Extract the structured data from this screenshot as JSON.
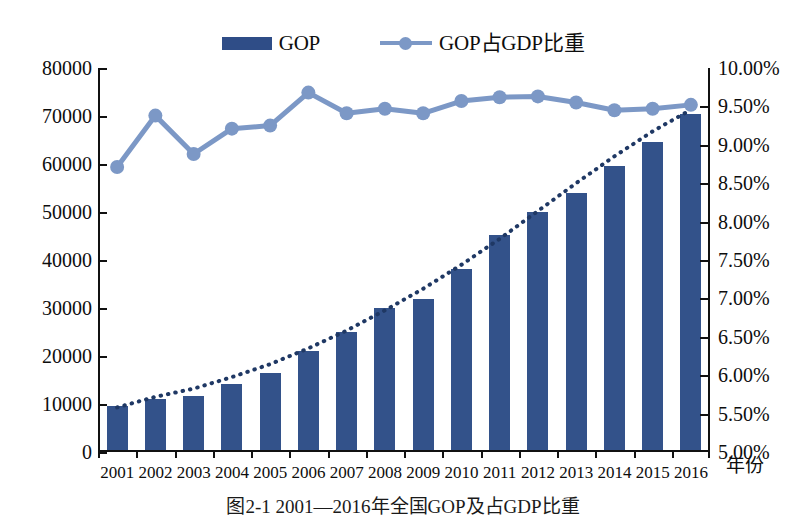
{
  "chart_data": {
    "type": "bar",
    "title": "",
    "xlabel": "年份",
    "categories": [
      "2001",
      "2002",
      "2003",
      "2004",
      "2005",
      "2006",
      "2007",
      "2008",
      "2009",
      "2010",
      "2011",
      "2012",
      "2013",
      "2014",
      "2015",
      "2016"
    ],
    "grid": false,
    "legend_position": "top-center",
    "series": [
      {
        "name": "GOP",
        "type": "bar",
        "axis": "left",
        "color": "#33528a",
        "values": [
          9500,
          11000,
          11700,
          14100,
          16500,
          21000,
          25000,
          29900,
          31800,
          38200,
          45300,
          50000,
          54000,
          59500,
          64500,
          70500
        ]
      },
      {
        "name": "GOP占GDP比重",
        "type": "line",
        "axis": "right",
        "color": "#7c98c6",
        "values": [
          8.71,
          9.38,
          8.88,
          9.21,
          9.25,
          9.68,
          9.41,
          9.47,
          9.41,
          9.57,
          9.62,
          9.63,
          9.55,
          9.45,
          9.47,
          9.52
        ]
      },
      {
        "name": "trend",
        "type": "dotted-trend",
        "axis": "left",
        "color": "#1f3864",
        "values": [
          9300,
          11500,
          13200,
          15600,
          18300,
          21600,
          25300,
          29500,
          34000,
          39000,
          44400,
          50200,
          56000,
          61600,
          66800,
          71300
        ]
      }
    ],
    "ylim": [
      0,
      80000
    ],
    "yticks": [
      "0",
      "10000",
      "20000",
      "30000",
      "40000",
      "50000",
      "60000",
      "70000",
      "80000"
    ],
    "ylim_right": [
      5.0,
      10.0
    ],
    "yticks_right": [
      "5.00%",
      "5.50%",
      "6.00%",
      "6.50%",
      "7.00%",
      "7.50%",
      "8.00%",
      "8.50%",
      "9.00%",
      "9.50%",
      "10.00%"
    ],
    "ylabel": "",
    "ylabel_right": ""
  },
  "legend": {
    "items": [
      {
        "label": "GOP",
        "marker": "bar-swatch"
      },
      {
        "label": "GOP占GDP比重",
        "marker": "line-marker-swatch"
      }
    ]
  },
  "caption": {
    "text": "图2-1  2001—2016年全国GOP及占GDP比重"
  }
}
